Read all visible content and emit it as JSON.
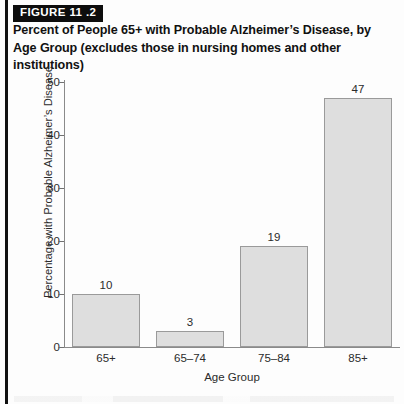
{
  "figure": {
    "badge": "FIGURE 11 .2",
    "title": "Percent of People 65+ with Probable Alzheimer’s Disease, by Age Group (excludes those in nursing homes and other institutions)"
  },
  "colors": {
    "bar_fill": "#dedede",
    "bar_border": "#9a9a9a",
    "axis": "#8a8a8a",
    "badge_background": "#0d0d0d",
    "badge_text": "#ffffff",
    "text": "#2b2b2b"
  },
  "chart_data": {
    "type": "bar",
    "title": "Percent of People 65+ with Probable Alzheimer’s Disease, by Age Group (excludes those in nursing homes and other institutions)",
    "categories": [
      "65+",
      "65–74",
      "75–84",
      "85+"
    ],
    "values": [
      10,
      3,
      19,
      47
    ],
    "xlabel": "Age Group",
    "ylabel": "Percentage with Probable Alzheimer’s Disease",
    "ylim": [
      0,
      50
    ],
    "yticks": [
      0,
      10,
      20,
      30,
      40,
      50
    ],
    "ytick_labels": [
      "0",
      "10",
      "20",
      "30",
      "40",
      "50"
    ],
    "value_labels": [
      "10",
      "3",
      "19",
      "47"
    ],
    "grid": false,
    "legend": null
  }
}
